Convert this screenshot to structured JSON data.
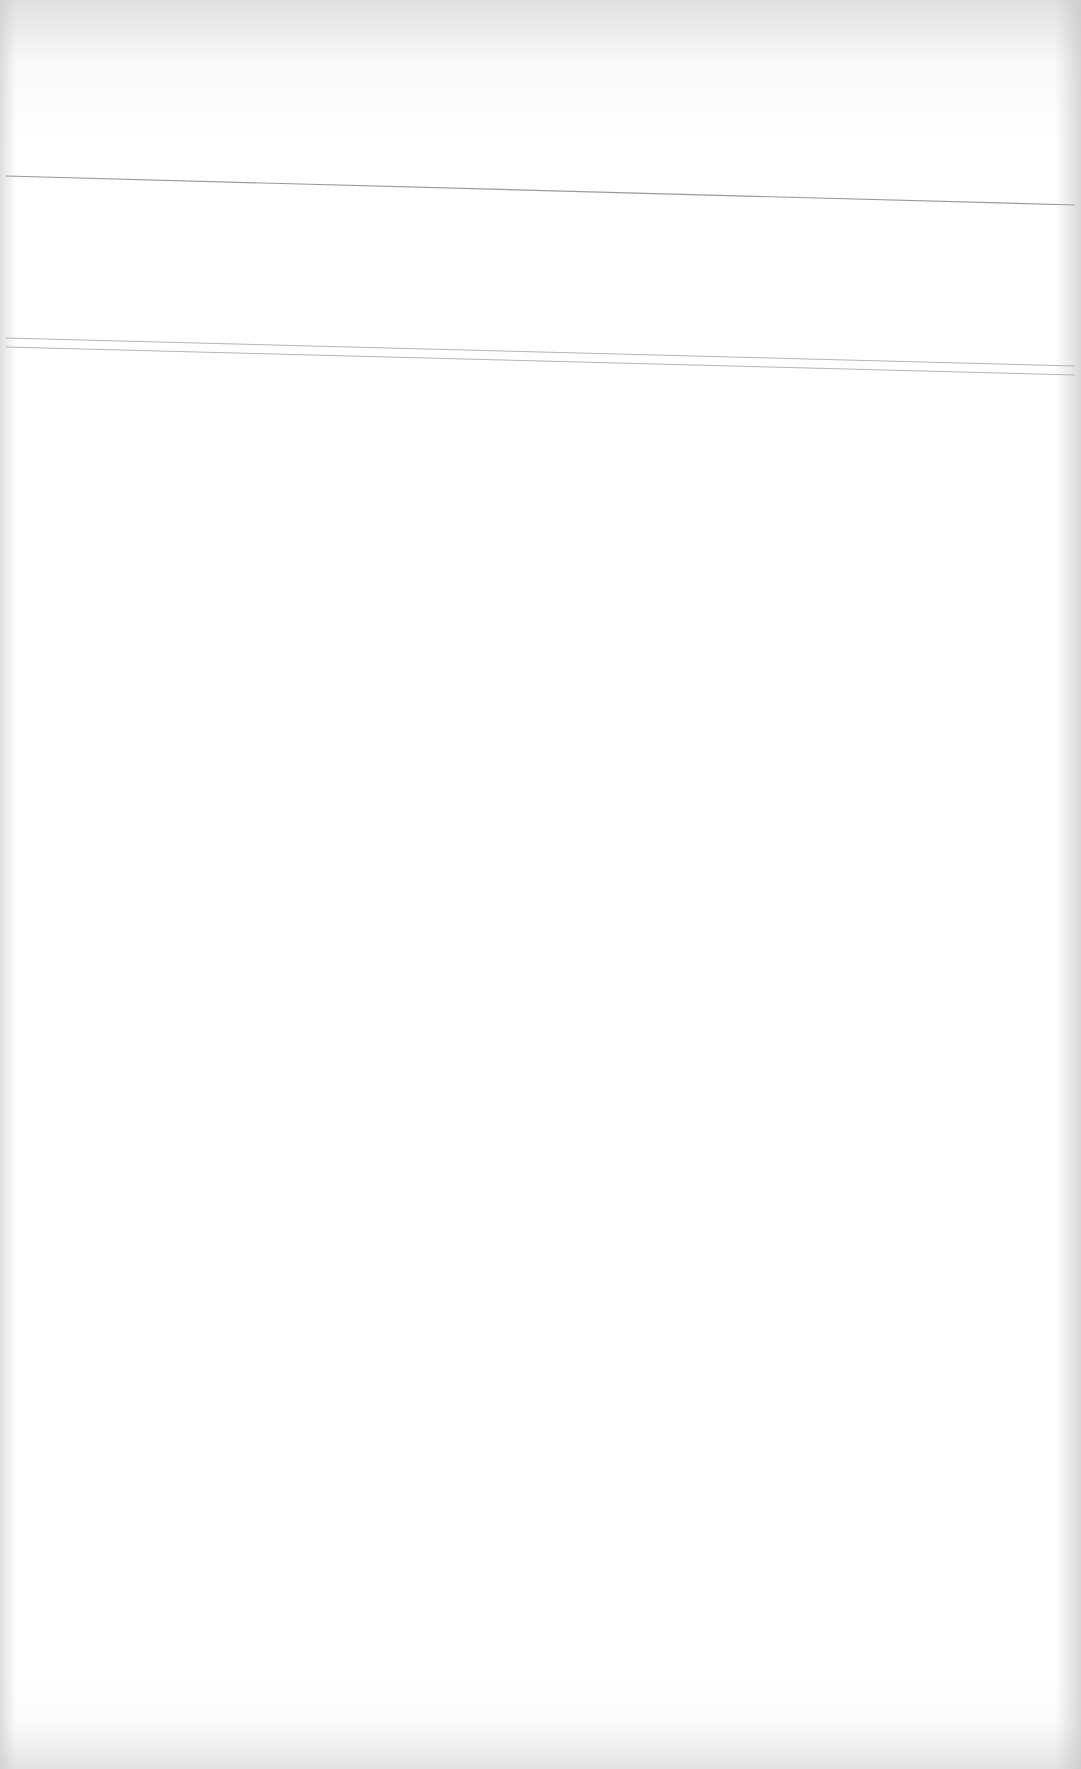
{
  "document": {
    "type": "blank-scanned-page",
    "text_content": [],
    "colors": {
      "paper": "#ffffff",
      "edge_shadow": "#cfcfcf",
      "rule_line": "#9a9a9a",
      "double_rule_line": "#b4b4b4"
    },
    "rules": [
      {
        "name": "single-rule",
        "x1": 6,
        "y1": 176,
        "x2": 1075,
        "y2": 205,
        "stroke": "#9a9a9a",
        "width": 1.2
      },
      {
        "name": "double-rule-upper",
        "x1": 6,
        "y1": 338,
        "x2": 1075,
        "y2": 366,
        "stroke": "#b4b4b4",
        "width": 1
      },
      {
        "name": "double-rule-lower",
        "x1": 6,
        "y1": 347,
        "x2": 1075,
        "y2": 375,
        "stroke": "#b4b4b4",
        "width": 1
      }
    ]
  }
}
